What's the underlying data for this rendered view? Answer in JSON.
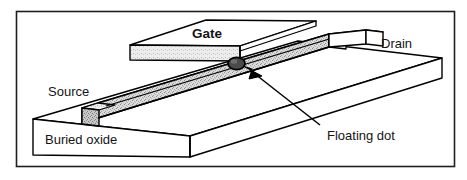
{
  "figure": {
    "kind": "3d-schematic",
    "border_color": "#1a1a1a",
    "line_color": "#000000",
    "background": "#ffffff"
  },
  "labels": {
    "gate": "Gate",
    "drain": "Drain",
    "source": "Source",
    "buried_oxide": "Buried oxide",
    "floating_dot": "Floating dot"
  },
  "parts": {
    "gate_electrode": {
      "name": "Gate",
      "top_face_fill": "#ffffff",
      "front_face_fill": "#e4e4e4"
    },
    "nanowire_channel": {
      "name": "Silicon nanowire channel",
      "top_face_fill": "#d0d0d0",
      "side_face_fill": "#bdbdbd",
      "end_face_fill": "#cccccc"
    },
    "buried_oxide_block": {
      "name": "Buried oxide",
      "top_face_fill": "#ffffff",
      "front_face_fill": "#ffffff",
      "side_face_fill": "#ffffff"
    },
    "floating_dot": {
      "name": "Floating dot",
      "fill": "#3a3a3a",
      "shape": "ellipse"
    },
    "pointer_arrow": {
      "name": "Floating dot pointer",
      "fill": "#000000"
    }
  }
}
